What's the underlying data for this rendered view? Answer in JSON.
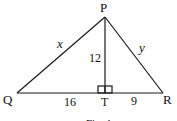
{
  "diagram": {
    "vertices": {
      "P": {
        "label": "P"
      },
      "Q": {
        "label": "Q"
      },
      "R": {
        "label": "R"
      },
      "T": {
        "label": "T"
      }
    },
    "sides": {
      "PQ": {
        "label": "x"
      },
      "PR": {
        "label": "y"
      },
      "PT": {
        "label": "12"
      },
      "QT": {
        "label": "16"
      },
      "TR": {
        "label": "9"
      }
    },
    "right_angle_at": "T",
    "caption": "Fig. 1"
  }
}
